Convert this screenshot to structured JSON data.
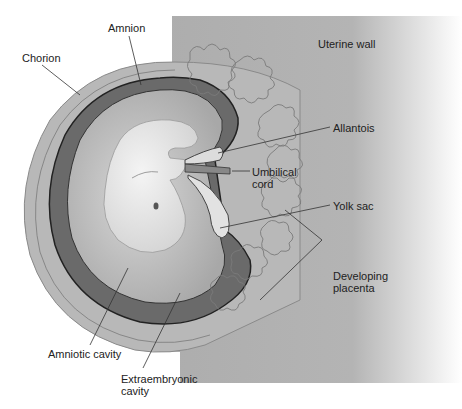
{
  "diagram": {
    "colors": {
      "uterine_wall": "#a9a9a9",
      "chorion": "#b5b5b5",
      "extraembryonic_cavity": "#6e6e6e",
      "amniotic_cavity": "#c4c4c4",
      "embryo": "#e6e6e6",
      "leader_line": "#333333",
      "text": "#222222"
    },
    "labels": {
      "uterine_wall": "Uterine wall",
      "amnion": "Amnion",
      "chorion": "Chorion",
      "allantois": "Allantois",
      "umbilical_cord": "Umbilical\ncord",
      "yolk_sac": "Yolk sac",
      "developing_placenta": "Developing\nplacenta",
      "amniotic_cavity": "Amniotic cavity",
      "extraembryonic_cavity": "Extraembryonic\ncavity"
    }
  }
}
